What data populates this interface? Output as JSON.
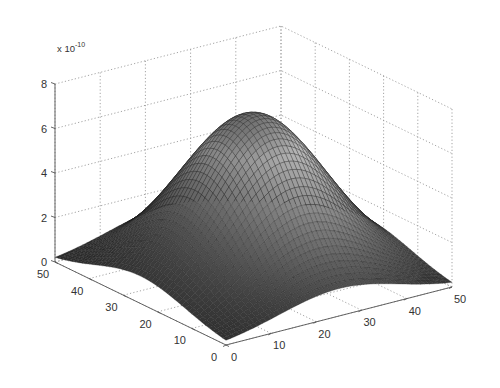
{
  "chart_data": {
    "type": "surface",
    "title": "",
    "xlabel": "",
    "ylabel": "",
    "zlabel": "",
    "z_multiplier_label": "x 10",
    "z_multiplier_exponent": "-10",
    "x_ticks": [
      "0",
      "10",
      "20",
      "30",
      "40",
      "50"
    ],
    "y_ticks": [
      "0",
      "10",
      "20",
      "30",
      "40",
      "50"
    ],
    "z_ticks": [
      "0",
      "2",
      "4",
      "6",
      "8"
    ],
    "xlim": [
      0,
      50
    ],
    "ylim": [
      0,
      50
    ],
    "zlim": [
      0,
      8
    ],
    "grid": true,
    "colormap": "gray",
    "edge_color": "#1a1a1a",
    "grid_size": 50,
    "surface_model": {
      "description": "Single smooth bell-shaped hump centered at (25,25), peak ~7.2e-10, decaying to near zero at corners",
      "center": [
        25,
        25
      ],
      "peak": 7.2,
      "sigma": 13.3
    },
    "sample_values": {
      "peak_at_center": 7.2,
      "edge_midpoints": 1.2,
      "corners": 0.2
    }
  },
  "axes": {
    "color": "#555555",
    "grid_color": "#9a9a9a"
  }
}
